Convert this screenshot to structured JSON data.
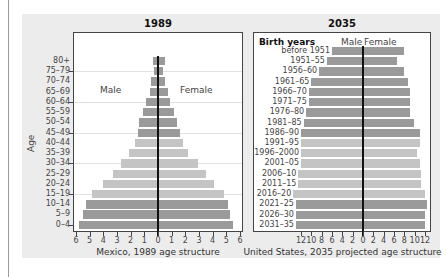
{
  "chart_data": [
    {
      "type": "bar",
      "subtype": "population-pyramid",
      "title": "1989",
      "xlabel": "Mexico, 1989 age structure",
      "ylabel": "Age",
      "xlim": [
        -6,
        6
      ],
      "x_ticks": [
        "6",
        "5",
        "4",
        "3",
        "2",
        "1",
        "0",
        "1",
        "2",
        "3",
        "4",
        "5",
        "6"
      ],
      "legend": {
        "left": "Male",
        "right": "Female"
      },
      "grid": true,
      "categories": [
        "80+",
        "75–79",
        "70–74",
        "65–69",
        "60–64",
        "55–59",
        "50–54",
        "45–49",
        "40–44",
        "35–39",
        "30–34",
        "25–29",
        "20–24",
        "15–19",
        "10–14",
        "5–9",
        "0–4"
      ],
      "series": [
        {
          "name": "Male",
          "values": [
            0.4,
            0.3,
            0.5,
            0.6,
            0.9,
            1.1,
            1.4,
            1.5,
            1.7,
            2.1,
            2.7,
            3.3,
            4.0,
            4.8,
            5.3,
            5.5,
            5.8
          ]
        },
        {
          "name": "Female",
          "values": [
            0.5,
            0.4,
            0.5,
            0.7,
            0.9,
            1.2,
            1.4,
            1.6,
            1.8,
            2.2,
            2.9,
            3.5,
            4.1,
            4.8,
            5.1,
            5.3,
            5.5
          ]
        }
      ],
      "bar_shades": [
        "dark",
        "dark",
        "dark",
        "dark",
        "dark",
        "dark",
        "dark",
        "dark",
        "light",
        "light",
        "light",
        "light",
        "light",
        "light",
        "dark",
        "dark",
        "dark"
      ]
    },
    {
      "type": "bar",
      "subtype": "population-pyramid",
      "title": "2035",
      "xlabel": "United States, 2035 projected age structure",
      "ylabel": "Birth years",
      "xlim": [
        -12,
        12
      ],
      "x_ticks": [
        "12",
        "10",
        "8",
        "6",
        "4",
        "2",
        "0",
        "2",
        "4",
        "6",
        "8",
        "10",
        "12"
      ],
      "legend": {
        "left": "Male",
        "right": "Female"
      },
      "grid": false,
      "categories": [
        "before 1951",
        "1951–55",
        "1956–60",
        "1961–65",
        "1966–70",
        "1971–75",
        "1976–80",
        "1981–85",
        "1986–90",
        "1991–95",
        "1996–2000",
        "2001–05",
        "2006–10",
        "2011–15",
        "2016–20",
        "2021–25",
        "2026–30",
        "2031–35"
      ],
      "series": [
        {
          "name": "Male",
          "values": [
            6.0,
            7.0,
            8.5,
            10.0,
            10.5,
            10.5,
            11.0,
            11.5,
            12.0,
            12.0,
            12.0,
            12.0,
            12.5,
            12.5,
            13.5,
            13.0,
            13.0,
            13.0
          ]
        },
        {
          "name": "Female",
          "values": [
            8.0,
            6.5,
            8.0,
            8.8,
            9.0,
            9.0,
            9.0,
            9.8,
            11.0,
            11.0,
            10.5,
            11.0,
            11.3,
            11.3,
            12.0,
            12.3,
            12.0,
            12.0
          ]
        }
      ],
      "bar_shades": [
        "dark",
        "dark",
        "dark",
        "dark",
        "dark",
        "dark",
        "dark",
        "dark",
        "dark",
        "light",
        "light",
        "light",
        "light",
        "light",
        "light",
        "dark",
        "dark",
        "dark"
      ]
    }
  ],
  "colors": {
    "dark": "#9a9a9a",
    "light": "#c4c4c4",
    "center_line": "#111111",
    "panel_bg": "#ececec"
  },
  "labels": {
    "title_left": "1989",
    "title_right": "2035",
    "male": "Male",
    "female": "Female",
    "age": "Age",
    "birth_years": "Birth years",
    "caption_left": "Mexico, 1989 age structure",
    "caption_right": "United States, 2035 projected age structure"
  }
}
